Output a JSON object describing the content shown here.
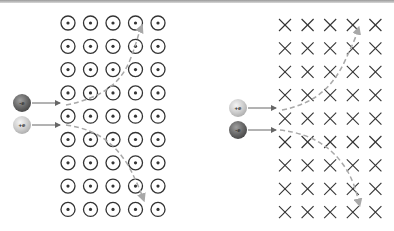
{
  "diagram": {
    "left_panel": {
      "field": "out-of-page",
      "field_symbol": "dot-in-circle",
      "grid_rows": 9,
      "grid_cols": 5,
      "particles": [
        {
          "label": "-e",
          "charge": "negative",
          "deflection": "up"
        },
        {
          "label": "+e",
          "charge": "positive",
          "deflection": "down"
        }
      ]
    },
    "right_panel": {
      "field": "into-page",
      "field_symbol": "cross",
      "grid_rows": 9,
      "grid_cols": 5,
      "particles": [
        {
          "label": "+e",
          "charge": "positive",
          "deflection": "up"
        },
        {
          "label": "-e",
          "charge": "negative",
          "deflection": "down"
        }
      ]
    },
    "colors": {
      "symbol": "#333333",
      "path": "#a8a8a8",
      "arrow": "#666666",
      "negative_particle": "#6a6a6a",
      "positive_particle": "#cfcfcf"
    }
  }
}
